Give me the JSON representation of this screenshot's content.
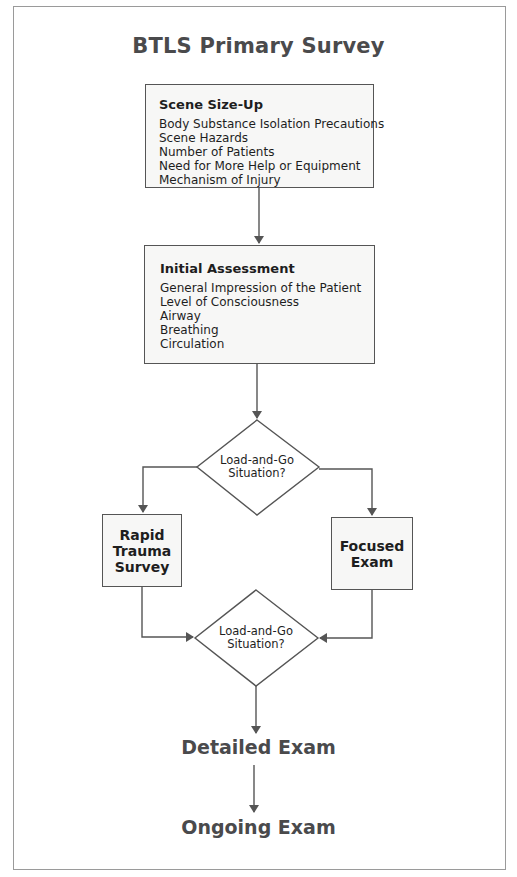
{
  "title": "BTLS Primary Survey",
  "scene_size_up": {
    "heading": "Scene Size-Up",
    "items": [
      "Body Substance Isolation Precautions",
      "Scene Hazards",
      "Number of Patients",
      "Need for More Help or Equipment",
      "Mechanism of Injury"
    ]
  },
  "initial_assessment": {
    "heading": "Initial Assessment",
    "items": [
      "General Impression of the Patient",
      "Level of Consciousness",
      "Airway",
      "Breathing",
      "Circulation"
    ]
  },
  "decision_1": {
    "line1": "Load-and-Go",
    "line2": "Situation?"
  },
  "rapid_trauma_survey": {
    "line1": "Rapid",
    "line2": "Trauma",
    "line3": "Survey"
  },
  "focused_exam": {
    "line1": "Focused",
    "line2": "Exam"
  },
  "decision_2": {
    "line1": "Load-and-Go",
    "line2": "Situation?"
  },
  "detailed_exam": "Detailed Exam",
  "ongoing_exam": "Ongoing Exam",
  "colors": {
    "line": "#555555",
    "box_fill": "#f7f7f6",
    "title": "#4a4a4c",
    "frame": "#9a9a9a"
  }
}
